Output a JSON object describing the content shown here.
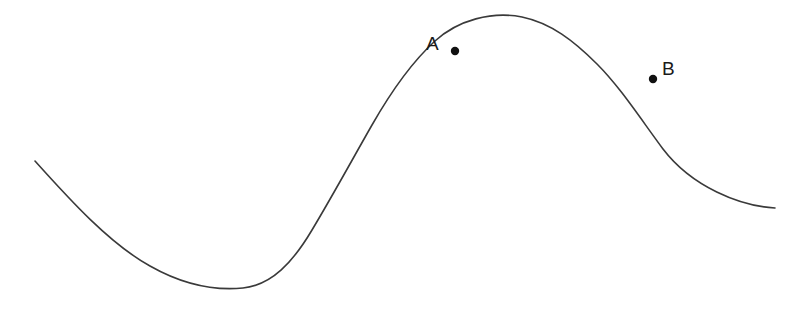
{
  "figure": {
    "width": 811,
    "height": 312,
    "background_color": "#ffffff",
    "curve_color": "#3a3a3a",
    "curve_stroke_width": 1.6,
    "marker_color": "#111111",
    "label_color": "#1a1a1a",
    "marker_radius": 4.2
  },
  "labels": {
    "point_a": "A",
    "point_b": "B"
  },
  "chart_data": {
    "type": "line",
    "title": "",
    "subtitle": "",
    "xlabel": "",
    "ylabel": "",
    "grid": false,
    "legend": "none",
    "axes_visible": false,
    "tick_labels": [],
    "xlim": [
      35,
      775
    ],
    "ylim": [
      288,
      17
    ],
    "series": [
      {
        "name": "curve",
        "x": [
          35,
          70,
          110,
          150,
          190,
          225,
          245,
          270,
          300,
          330,
          360,
          390,
          420,
          455,
          485,
          522,
          560,
          600,
          625,
          653,
          690,
          730,
          775
        ],
        "y": [
          161,
          197,
          233,
          258,
          277,
          286,
          288,
          283,
          240,
          205,
          172,
          133,
          90,
          51,
          30,
          17,
          25,
          46,
          64,
          79,
          117,
          158,
          208
        ]
      }
    ],
    "annotations": [
      {
        "name": "A",
        "label": "A",
        "x": 455,
        "y": 51,
        "label_x": 433,
        "label_y": 43,
        "label_position": "left",
        "description": "Point A on the rising side of the curve, before the maximum"
      },
      {
        "name": "B",
        "label": "B",
        "x": 653,
        "y": 79,
        "label_x": 669,
        "label_y": 68,
        "label_position": "upper-right",
        "description": "Point B on the falling side of the curve, after the maximum"
      }
    ],
    "features": {
      "start_point": [
        35,
        161
      ],
      "minimum": [
        240,
        288
      ],
      "maximum": [
        522,
        17
      ],
      "end_point": [
        775,
        208
      ],
      "inflection_rising": [
        370,
        158
      ],
      "inflection_falling": [
        648,
        76
      ]
    }
  }
}
